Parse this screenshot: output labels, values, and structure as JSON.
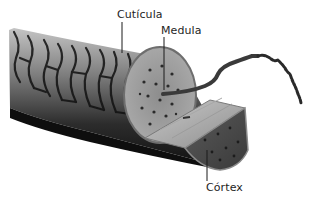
{
  "diagram": {
    "labels": [
      {
        "id": "cuticula",
        "text": "Cutícula"
      },
      {
        "id": "medula",
        "text": "Medula"
      },
      {
        "id": "cortex",
        "text": "Córtex"
      }
    ],
    "colors": {
      "background": "#ffffff",
      "label_text": "#1e1e1e",
      "leader_line": "#1a1a1a",
      "cuticle_dark": "#1c1c1c",
      "cuticle_mid": "#6a6a6a",
      "cuticle_light": "#b0b0b0",
      "cortex_face": "#9a9a9a",
      "cortex_slab": "#b8b8b8",
      "medulla_dots": "#2a2a2a"
    }
  }
}
